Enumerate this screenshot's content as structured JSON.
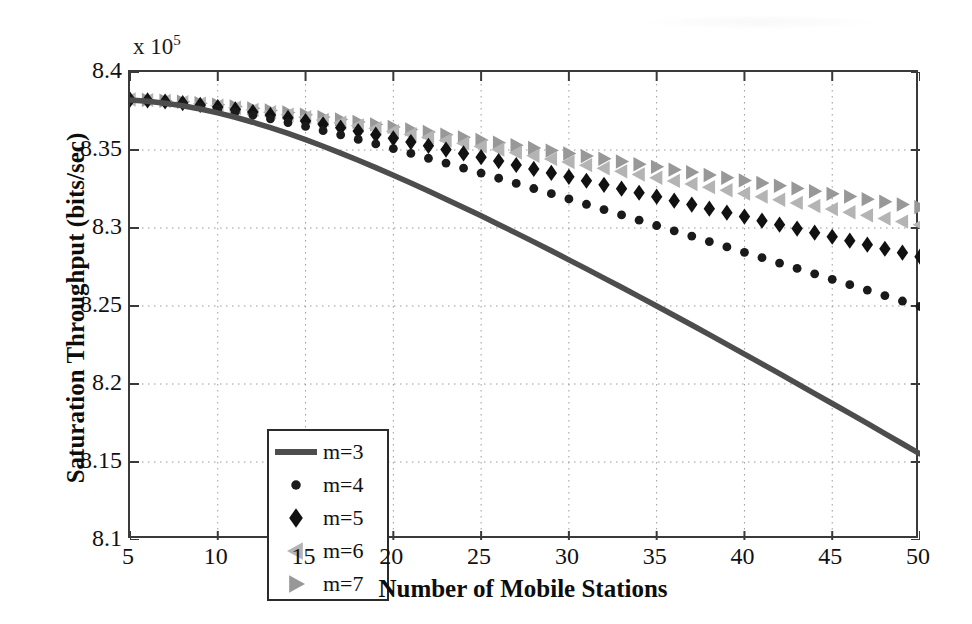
{
  "chart_data": {
    "type": "scatter",
    "title": "",
    "xlabel": "Number of Mobile Stations",
    "ylabel": "Saturation Throughput (bits/sec)",
    "y_exponent_label": "x 10",
    "y_exponent_power": "5",
    "xlim": [
      5,
      50
    ],
    "ylim": [
      8.1,
      8.4
    ],
    "xticks": [
      5,
      10,
      15,
      20,
      25,
      30,
      35,
      40,
      45,
      50
    ],
    "yticks": [
      "8.1",
      "8.15",
      "8.2",
      "8.25",
      "8.3",
      "8.35",
      "8.4"
    ],
    "ytick_values": [
      8.1,
      8.15,
      8.2,
      8.25,
      8.3,
      8.35,
      8.4
    ],
    "grid": true,
    "grid_style": "dotted",
    "legend_position": "lower-left",
    "x": [
      5,
      6,
      7,
      8,
      9,
      10,
      11,
      12,
      13,
      14,
      15,
      16,
      17,
      18,
      19,
      20,
      21,
      22,
      23,
      24,
      25,
      26,
      27,
      28,
      29,
      30,
      31,
      32,
      33,
      34,
      35,
      36,
      37,
      38,
      39,
      40,
      41,
      42,
      43,
      44,
      45,
      46,
      47,
      48,
      49,
      50
    ],
    "series": [
      {
        "name": "m=3",
        "label": "m=3",
        "marker": "line",
        "color": "#4d4d4d",
        "values": [
          8.382,
          8.3812,
          8.38,
          8.3784,
          8.3763,
          8.3738,
          8.371,
          8.3678,
          8.3643,
          8.3606,
          8.3566,
          8.3524,
          8.348,
          8.3434,
          8.3387,
          8.3338,
          8.3288,
          8.3237,
          8.3185,
          8.3132,
          8.3078,
          8.3023,
          8.2967,
          8.2911,
          8.2854,
          8.2796,
          8.2738,
          8.2679,
          8.262,
          8.256,
          8.25,
          8.2439,
          8.2378,
          8.2316,
          8.2254,
          8.2192,
          8.2129,
          8.2066,
          8.2003,
          8.1939,
          8.1875,
          8.1811,
          8.1747,
          8.1682,
          8.1617,
          8.1552
        ]
      },
      {
        "name": "m=4",
        "label": "m=4",
        "marker": "circle",
        "color": "#1a1a1a",
        "values": [
          8.3822,
          8.3816,
          8.3807,
          8.3795,
          8.378,
          8.3763,
          8.3744,
          8.3723,
          8.37,
          8.3676,
          8.3651,
          8.3624,
          8.3597,
          8.3568,
          8.3539,
          8.3509,
          8.3478,
          8.3447,
          8.3416,
          8.3384,
          8.3352,
          8.3319,
          8.3286,
          8.3253,
          8.322,
          8.3186,
          8.3152,
          8.3118,
          8.3084,
          8.305,
          8.3016,
          8.2982,
          8.2948,
          8.2913,
          8.2879,
          8.2844,
          8.281,
          8.2775,
          8.2741,
          8.2706,
          8.2671,
          8.2637,
          8.2602,
          8.2567,
          8.2532,
          8.2497
        ]
      },
      {
        "name": "m=5",
        "label": "m=5",
        "marker": "diamond",
        "color": "#111111",
        "values": [
          8.3823,
          8.3818,
          8.3811,
          8.3801,
          8.3789,
          8.3775,
          8.376,
          8.3743,
          8.3725,
          8.3706,
          8.3686,
          8.3665,
          8.3643,
          8.3621,
          8.3598,
          8.3575,
          8.3551,
          8.3527,
          8.3503,
          8.3478,
          8.3454,
          8.3429,
          8.3404,
          8.3379,
          8.3353,
          8.3328,
          8.3303,
          8.3277,
          8.3252,
          8.3226,
          8.3201,
          8.3175,
          8.315,
          8.3124,
          8.3098,
          8.3073,
          8.3047,
          8.3021,
          8.2996,
          8.297,
          8.2944,
          8.2919,
          8.2893,
          8.2867,
          8.2842,
          8.2816
        ]
      },
      {
        "name": "m=6",
        "label": "m=6",
        "marker": "triangle-left",
        "color": "#b4b4b4",
        "values": [
          8.3824,
          8.382,
          8.3814,
          8.3806,
          8.3796,
          8.3784,
          8.3771,
          8.3757,
          8.3742,
          8.3726,
          8.371,
          8.3693,
          8.3675,
          8.3657,
          8.3639,
          8.362,
          8.3601,
          8.3582,
          8.3562,
          8.3543,
          8.3523,
          8.3503,
          8.3483,
          8.3463,
          8.3443,
          8.3423,
          8.3403,
          8.3383,
          8.3363,
          8.3343,
          8.3322,
          8.3302,
          8.3282,
          8.3262,
          8.3242,
          8.3221,
          8.3201,
          8.3181,
          8.3161,
          8.3141,
          8.3121,
          8.3101,
          8.3081,
          8.3061,
          8.3041,
          8.3021
        ]
      },
      {
        "name": "m=7",
        "label": "m=7",
        "marker": "triangle-right",
        "color": "#989898",
        "values": [
          8.3825,
          8.3821,
          8.3816,
          8.3809,
          8.38,
          8.379,
          8.3779,
          8.3767,
          8.3754,
          8.374,
          8.3726,
          8.3711,
          8.3696,
          8.368,
          8.3664,
          8.3648,
          8.3632,
          8.3615,
          8.3598,
          8.3581,
          8.3564,
          8.3547,
          8.353,
          8.3513,
          8.3496,
          8.3478,
          8.3461,
          8.3444,
          8.3426,
          8.3409,
          8.3392,
          8.3374,
          8.3357,
          8.334,
          8.3322,
          8.3305,
          8.3288,
          8.3271,
          8.3254,
          8.3236,
          8.3219,
          8.3202,
          8.3185,
          8.3168,
          8.3151,
          8.3134
        ]
      }
    ]
  },
  "axis": {
    "y_exponent": "x 10",
    "y_exponent_sup": "5",
    "y_title": "Saturation Throughput (bits/sec)",
    "x_title": "Number of Mobile Stations"
  },
  "legend": {
    "items": [
      {
        "label": "m=3",
        "marker": "line",
        "color": "#4d4d4d"
      },
      {
        "label": "m=4",
        "marker": "circle",
        "color": "#1a1a1a"
      },
      {
        "label": "m=5",
        "marker": "diamond",
        "color": "#111111"
      },
      {
        "label": "m=6",
        "marker": "triangle-left",
        "color": "#b4b4b4"
      },
      {
        "label": "m=7",
        "marker": "triangle-right",
        "color": "#989898"
      }
    ]
  }
}
